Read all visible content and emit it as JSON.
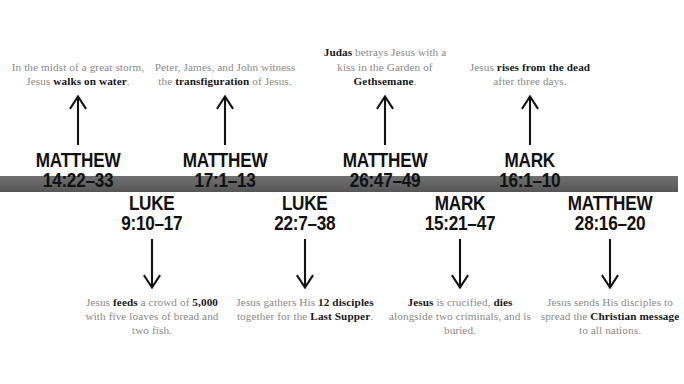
{
  "graphic": {
    "type": "timeline",
    "orientation": "horizontal",
    "bar_color": "#626262",
    "caption_color": "#8a8a8a",
    "emphasis_color": "#16181a",
    "reference_color": "#101214"
  },
  "events": [
    {
      "position": "top",
      "center_x": 78,
      "reference_book": "MATTHEW",
      "reference_verse": "14:22–33",
      "caption_html": "In the midst of a great storm, Jesus <b>walks on water</b>.",
      "caption_plain": "In the midst of a great storm, Jesus walks on water.",
      "arrow_direction": "up"
    },
    {
      "position": "top",
      "center_x": 225,
      "reference_book": "MATTHEW",
      "reference_verse": "17:1–13",
      "caption_html": "Peter, James, and John witness the <b>transfiguration</b> of Jesus.",
      "caption_plain": "Peter, James, and John witness the transfiguration of Jesus.",
      "arrow_direction": "up"
    },
    {
      "position": "top",
      "center_x": 385,
      "reference_book": "MATTHEW",
      "reference_verse": "26:47–49",
      "caption_html": "<b>Judas</b> betrays Jesus with a kiss in the Garden of <b>Gethsemane</b>.",
      "caption_plain": "Judas betrays Jesus with a kiss in the Garden of Gethsemane.",
      "arrow_direction": "up"
    },
    {
      "position": "top",
      "center_x": 530,
      "reference_book": "MARK",
      "reference_verse": "16:1–10",
      "caption_html": "Jesus <b>rises from the dead</b> after three days.",
      "caption_plain": "Jesus rises from the dead after three days.",
      "arrow_direction": "up"
    },
    {
      "position": "bottom",
      "center_x": 152,
      "reference_book": "LUKE",
      "reference_verse": "9:10–17",
      "caption_html": "Jesus <b>feeds</b> a crowd of <b>5,000</b> with five loaves of bread and two fish.",
      "caption_plain": "Jesus feeds a crowd of 5,000 with five loaves of bread and two fish.",
      "arrow_direction": "down"
    },
    {
      "position": "bottom",
      "center_x": 305,
      "reference_book": "LUKE",
      "reference_verse": "22:7–38",
      "caption_html": "Jesus gathers His <b>12 disciples</b> together for the <b>Last Supper</b>.",
      "caption_plain": "Jesus gathers His 12 disciples together for the Last Supper.",
      "arrow_direction": "down"
    },
    {
      "position": "bottom",
      "center_x": 460,
      "reference_book": "MARK",
      "reference_verse": "15:21–47",
      "caption_html": "<b>Jesus</b> is crucified, <b>dies</b> alongside two criminals, and is buried.",
      "caption_plain": "Jesus is crucified, dies alongside two criminals, and is buried.",
      "arrow_direction": "down"
    },
    {
      "position": "bottom",
      "center_x": 610,
      "reference_book": "MATTHEW",
      "reference_verse": "28:16–20",
      "caption_html": "Jesus sends His disciples to spread the <b>Christian message</b> to all nations.",
      "caption_plain": "Jesus sends His disciples to spread the Christian message to all nations.",
      "arrow_direction": "down"
    }
  ]
}
